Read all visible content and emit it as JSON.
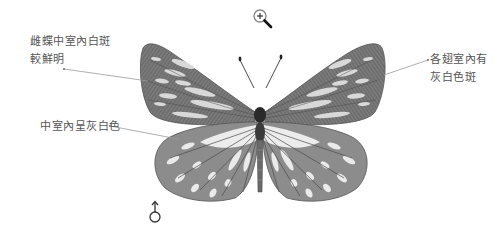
{
  "annotations": [
    {
      "id": "forewing-cell-spot",
      "lines": [
        "雌蝶中室內白斑",
        "較鮮明"
      ]
    },
    {
      "id": "hindwing-cell",
      "lines": [
        "中室內呈灰白色"
      ]
    },
    {
      "id": "forewing-spaces",
      "lines": [
        "各翅室內有",
        "灰白色斑"
      ]
    }
  ],
  "sex_symbol": "♂",
  "cursor": "zoom-in-icon",
  "colors": {
    "background": "#ffffff",
    "wing_dark": "#5a5a5a",
    "wing_mid": "#8a8a8a",
    "wing_light": "#e8e8e8",
    "label_text": "#555555",
    "leader_line": "#9a9a9a"
  }
}
